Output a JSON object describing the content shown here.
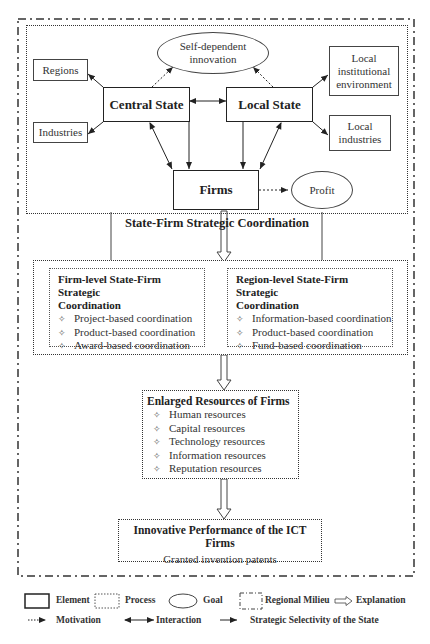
{
  "diagram": {
    "top_panel": {
      "nodes": {
        "central_state": "Central State",
        "local_state": "Local State",
        "firms": "Firms",
        "self_dependent_innovation_line1": "Self-dependent",
        "self_dependent_innovation_line2": "innovation",
        "profit": "Profit",
        "regions": "Regions",
        "industries": "Industries",
        "local_institutional_env_line1": "Local",
        "local_institutional_env_line2": "institutional",
        "local_institutional_env_line3": "environment",
        "local_industries_line1": "Local",
        "local_industries_line2": "industries"
      }
    },
    "coordination_label": "State-Firm Strategic Coordination",
    "firm_level": {
      "title_line1": "Firm-level State-Firm Strategic",
      "title_line2": "Coordination",
      "items": [
        "Project-based coordination",
        "Product-based coordination",
        "Award-based coordination"
      ]
    },
    "region_level": {
      "title_line1": "Region-level State-Firm Strategic",
      "title_line2": "Coordination",
      "items": [
        "Information-based coordination",
        "Product-based coordination",
        "Fund-based coordination"
      ]
    },
    "resources": {
      "title": "Enlarged Resources of Firms",
      "items": [
        "Human resources",
        "Capital resources",
        "Technology resources",
        "Information resources",
        "Reputation resources"
      ]
    },
    "performance": {
      "title": "Innovative Performance of the ICT Firms",
      "subtitle": "Granted invention patents"
    },
    "bullet_glyph": "✧"
  },
  "legend": {
    "element": "Element",
    "process": "Process",
    "goal": "Goal",
    "regional_milieu": "Regional Milieu",
    "explanation": "Explanation",
    "motivation": "Motivation",
    "interaction": "Interaction",
    "strategic_selectivity": "Strategic Selectivity of the State"
  }
}
